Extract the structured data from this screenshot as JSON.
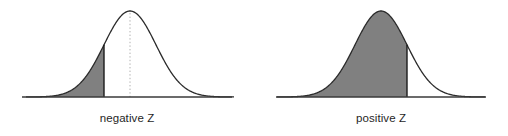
{
  "figure": {
    "background_color": "#ffffff",
    "width": 508,
    "height": 136
  },
  "style": {
    "fill_color": "#808080",
    "curve_color": "#2b2b2b",
    "axis_color": "#3a3a3a",
    "cutoff_line_color": "#1a1a1a",
    "mean_line_color": "#b0b0b0",
    "label_color": "#1f1f1f"
  },
  "panels": [
    {
      "id": "negative-z",
      "label": "negative Z",
      "shade_side": "left",
      "cutoff_sigma": -1.0,
      "mean_line_visible": true,
      "shading_includes_peak": false
    },
    {
      "id": "positive-z",
      "label": "positive Z",
      "shade_side": "left",
      "cutoff_sigma": 1.0,
      "mean_line_visible": false,
      "shading_includes_peak": true
    }
  ],
  "chart_data": {
    "type": "area",
    "title": "",
    "xlabel": "",
    "ylabel": "",
    "grid": false,
    "legend_position": "none",
    "xlim": [
      -4,
      4
    ],
    "ylim": [
      0,
      0.42
    ],
    "distribution": "standard normal (mean 0, sd 1)",
    "charts": [
      {
        "name": "negative Z",
        "caption": "negative Z",
        "cutoff_z": -1.0,
        "shaded_region": "z < -1.0 (lower tail)",
        "shaded_area": 0.1587,
        "mean_reference_line_z": 0.0,
        "x": [
          -4,
          -3.5,
          -3,
          -2.5,
          -2,
          -1.5,
          -1,
          -0.5,
          0,
          0.5,
          1,
          1.5,
          2,
          2.5,
          3,
          3.5,
          4
        ],
        "y": [
          0.0001,
          0.0009,
          0.0044,
          0.0175,
          0.054,
          0.1295,
          0.242,
          0.3521,
          0.3989,
          0.3521,
          0.242,
          0.1295,
          0.054,
          0.0175,
          0.0044,
          0.0009,
          0.0001
        ]
      },
      {
        "name": "positive Z",
        "caption": "positive Z",
        "cutoff_z": 1.0,
        "shaded_region": "z < 1.0 (left of cutoff, includes peak)",
        "shaded_area": 0.8413,
        "mean_reference_line_z": null,
        "x": [
          -4,
          -3.5,
          -3,
          -2.5,
          -2,
          -1.5,
          -1,
          -0.5,
          0,
          0.5,
          1,
          1.5,
          2,
          2.5,
          3,
          3.5,
          4
        ],
        "y": [
          0.0001,
          0.0009,
          0.0044,
          0.0175,
          0.054,
          0.1295,
          0.242,
          0.3521,
          0.3989,
          0.3521,
          0.242,
          0.1295,
          0.054,
          0.0175,
          0.0044,
          0.0009,
          0.0001
        ]
      }
    ]
  }
}
